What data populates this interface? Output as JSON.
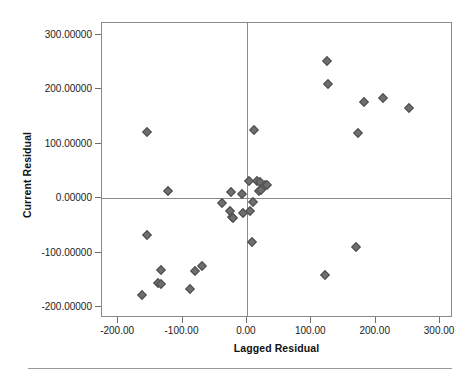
{
  "chart_data": {
    "type": "scatter",
    "title": "",
    "xlabel": "Lagged Residual",
    "ylabel": "Current Residual",
    "xlim": [
      -225,
      320
    ],
    "ylim": [
      -220,
      322
    ],
    "grid": false,
    "legend": null,
    "reference_lines": {
      "x": 0,
      "y": 0
    },
    "marker": {
      "shape": "diamond",
      "color": "#6e6e6e",
      "edge_color": "#4d4d4d",
      "size": 7
    },
    "xticks": [
      -200,
      -100,
      0,
      100,
      200,
      300
    ],
    "xtick_labels": [
      "-200.00",
      "-100.00",
      "0.00",
      "100.00",
      "200.00",
      "300.00"
    ],
    "yticks": [
      -200,
      -100,
      0,
      100,
      200,
      300
    ],
    "ytick_labels": [
      "-200.00000",
      "-100.00000",
      "0.00000",
      "100.00000",
      "200.00000",
      "300.00000"
    ],
    "points": [
      {
        "x": -163,
        "y": -177
      },
      {
        "x": -155,
        "y": -67
      },
      {
        "x": -155,
        "y": 122
      },
      {
        "x": -138,
        "y": -156
      },
      {
        "x": -134,
        "y": -158
      },
      {
        "x": -133,
        "y": -132
      },
      {
        "x": -122,
        "y": 13
      },
      {
        "x": -89,
        "y": -166
      },
      {
        "x": -81,
        "y": -134
      },
      {
        "x": -70,
        "y": -124
      },
      {
        "x": -38,
        "y": -8
      },
      {
        "x": -26,
        "y": -23
      },
      {
        "x": -24,
        "y": 11
      },
      {
        "x": -23,
        "y": -34
      },
      {
        "x": -22,
        "y": -37
      },
      {
        "x": -8,
        "y": 8
      },
      {
        "x": -6,
        "y": -27
      },
      {
        "x": 3,
        "y": 31
      },
      {
        "x": 5,
        "y": -23
      },
      {
        "x": 8,
        "y": -80
      },
      {
        "x": 9,
        "y": -6
      },
      {
        "x": 11,
        "y": 125
      },
      {
        "x": 16,
        "y": 32
      },
      {
        "x": 18,
        "y": 13
      },
      {
        "x": 20,
        "y": 30
      },
      {
        "x": 22,
        "y": 16
      },
      {
        "x": 28,
        "y": 24
      },
      {
        "x": 31,
        "y": 25
      },
      {
        "x": 122,
        "y": -141
      },
      {
        "x": 124,
        "y": 252
      },
      {
        "x": 126,
        "y": 210
      },
      {
        "x": 170,
        "y": -89
      },
      {
        "x": 172,
        "y": 120
      },
      {
        "x": 182,
        "y": 176
      },
      {
        "x": 211,
        "y": 184
      },
      {
        "x": 251,
        "y": 165
      }
    ]
  }
}
